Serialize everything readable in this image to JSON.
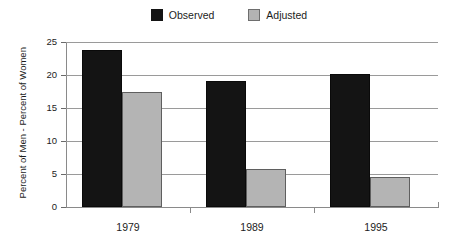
{
  "chart_data": {
    "type": "bar",
    "title": "",
    "subtitle": "",
    "xlabel": "",
    "ylabel": "Percent of Men - Percent of Women",
    "categories": [
      "1979",
      "1989",
      "1995"
    ],
    "series": [
      {
        "name": "Observed",
        "color": "#141414",
        "values": [
          23.8,
          19.1,
          20.2
        ]
      },
      {
        "name": "Adjusted",
        "color": "#b4b4b4",
        "values": [
          17.4,
          5.7,
          4.6
        ]
      }
    ],
    "ylim": [
      0,
      25
    ],
    "yticks": [
      0,
      5,
      10,
      15,
      20,
      25
    ],
    "ytick_labels": [
      "0",
      "5",
      "10",
      "15",
      "20",
      "25"
    ],
    "grid": true,
    "grid_axis": "y",
    "legend_position": "top-center",
    "annotations": []
  },
  "legend": {
    "entries": [
      {
        "label": "Observed",
        "swatch": "observed-swatch"
      },
      {
        "label": "Adjusted",
        "swatch": "adjusted-swatch"
      }
    ]
  },
  "colors": {
    "observed": "#141414",
    "adjusted": "#b4b4b4",
    "gridline": "#9a9a9a",
    "axis": "#8a8a8a",
    "text": "#1c1c1c",
    "background": "#ffffff"
  }
}
